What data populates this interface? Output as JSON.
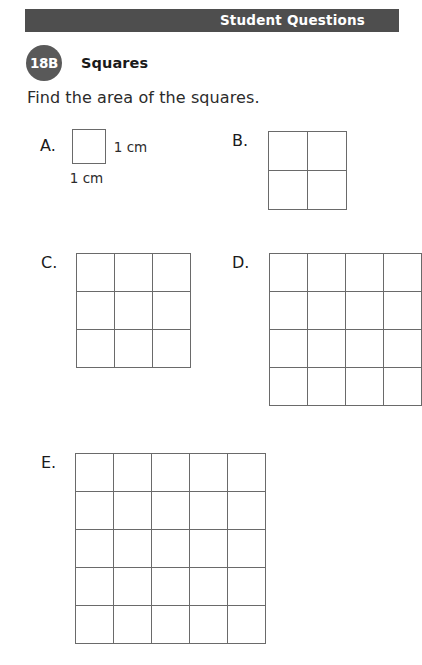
{
  "header": {
    "title": "Student Questions",
    "background_color": "#4e4e4e",
    "text_color": "#ffffff"
  },
  "lesson": {
    "badge": "18B",
    "badge_color": "#595959",
    "title": "Squares"
  },
  "instruction": "Find the area of the squares.",
  "problems": [
    {
      "label": "A.",
      "rows": 1,
      "cols": 1,
      "cells": 1,
      "dim_right": "1 cm",
      "dim_bottom": "1 cm",
      "clipped": false
    },
    {
      "label": "B.",
      "rows": 2,
      "cols": 2,
      "cells": 4,
      "clipped": false
    },
    {
      "label": "C.",
      "rows": 3,
      "cols": 3,
      "cells": 9,
      "clipped": false
    },
    {
      "label": "D.",
      "rows": 4,
      "cols": 4,
      "cells": 16,
      "clipped": true
    },
    {
      "label": "E.",
      "rows": 5,
      "cols": 5,
      "cells": 25,
      "clipped": false
    }
  ],
  "colors": {
    "grid_line": "#6a6a6a",
    "page_background": "#ffffff",
    "body_text": "#1a1a1a"
  }
}
